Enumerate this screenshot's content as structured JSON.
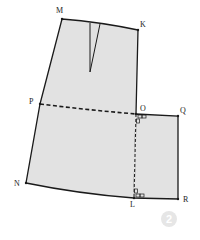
{
  "diagram": {
    "type": "pattern-drafting",
    "colors": {
      "fill": "#e2e2e2",
      "stroke": "#1a1a1a",
      "badge": "#e6e6e6"
    },
    "points": {
      "M": "M",
      "K": "K",
      "P": "P",
      "O": "O",
      "Q": "Q",
      "N": "N",
      "L": "L",
      "R": "R"
    },
    "step_badge": "2"
  }
}
